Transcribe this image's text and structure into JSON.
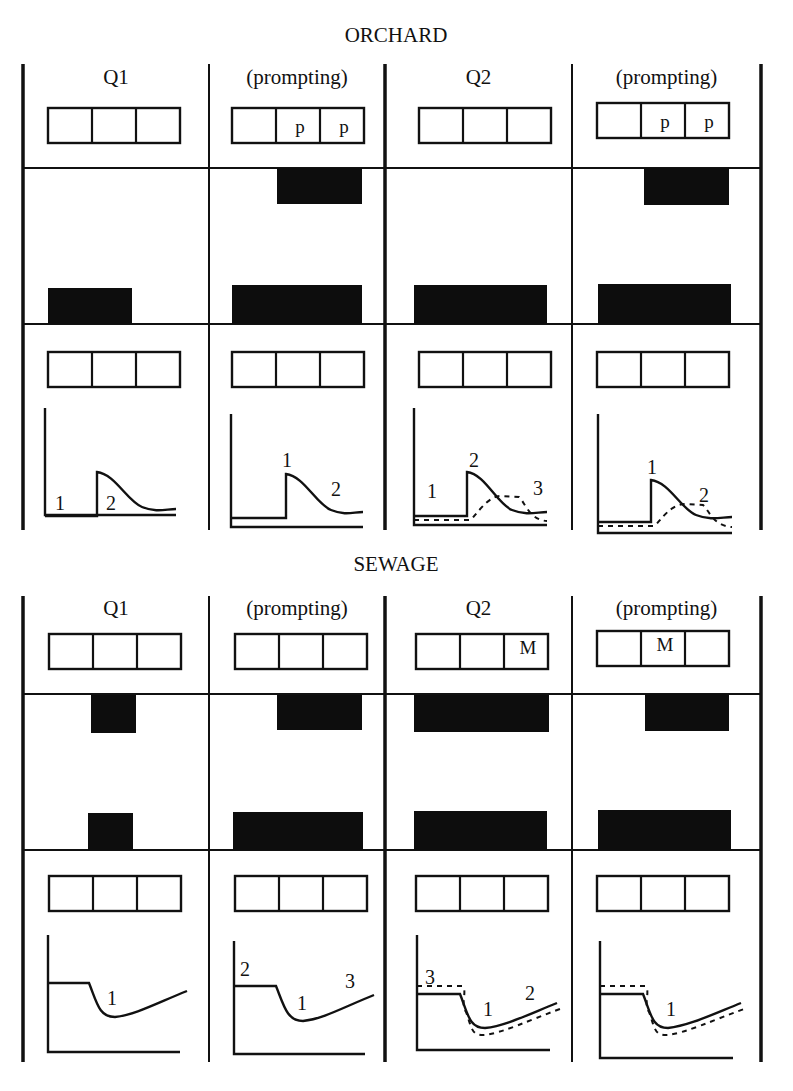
{
  "figure": {
    "stroke_color": "#111111",
    "fill_color": "#0d0d0d",
    "background": "#ffffff"
  },
  "panels": [
    {
      "title": "ORCHARD",
      "title_y": 42,
      "top": 62,
      "frame_top": 64,
      "frame_bottom": 530,
      "row_header_y": 84,
      "box_row1_y": 108,
      "hline1_y": 168,
      "hline2_y": 324,
      "box_row2_y": 352,
      "chart_top": 408,
      "chart_bottom": 527,
      "columns": [
        {
          "header": "Q1",
          "top_cells": [
            "",
            "",
            ""
          ],
          "top_box_x": 48,
          "upper_block": null,
          "lower_block": {
            "x": 48,
            "w": 84,
            "top": 288
          },
          "chart": {
            "type": "orchard-step",
            "baseline_y": 515,
            "axis_x": 45,
            "axis_right": 176,
            "step_x": 97,
            "low_y": 516,
            "peak_y": 472,
            "tail_y": 509,
            "dashed": false,
            "labels": [
              {
                "text": "1",
                "x": 55,
                "y": 510
              },
              {
                "text": "2",
                "x": 106,
                "y": 510
              }
            ]
          }
        },
        {
          "header": "(prompting)",
          "top_cells": [
            "",
            "p",
            "p"
          ],
          "top_box_x": 232,
          "upper_block": {
            "x": 277,
            "w": 85,
            "top": 168,
            "bottom": 204
          },
          "lower_block": {
            "x": 232,
            "w": 130,
            "top": 285
          },
          "chart": {
            "type": "orchard-step",
            "baseline_y": 527,
            "axis_x": 231,
            "axis_right": 363,
            "step_x": 286,
            "low_y": 518,
            "peak_y": 474,
            "tail_y": 512,
            "dashed": false,
            "labels": [
              {
                "text": "1",
                "x": 282,
                "y": 467
              },
              {
                "text": "2",
                "x": 331,
                "y": 496
              }
            ]
          }
        },
        {
          "header": "Q2",
          "top_cells": [
            "",
            "",
            ""
          ],
          "top_box_x": 419,
          "upper_block": null,
          "lower_block": {
            "x": 414,
            "w": 133,
            "top": 285
          },
          "chart": {
            "type": "orchard-step",
            "baseline_y": 525,
            "axis_x": 414,
            "axis_right": 547,
            "step_x": 467,
            "low_y": 516,
            "peak_y": 472,
            "tail_y": 512,
            "dashed": true,
            "labels": [
              {
                "text": "1",
                "x": 427,
                "y": 498
              },
              {
                "text": "2",
                "x": 469,
                "y": 467
              },
              {
                "text": "3",
                "x": 533,
                "y": 495
              }
            ]
          }
        },
        {
          "header": "(prompting)",
          "top_cells": [
            "",
            "p",
            "p"
          ],
          "top_box_x": 597,
          "upper_block": {
            "x": 644,
            "w": 85,
            "top": 168,
            "bottom": 205
          },
          "lower_block": {
            "x": 598,
            "w": 133,
            "top": 284
          },
          "chart": {
            "type": "orchard-step",
            "baseline_y": 533,
            "axis_x": 598,
            "axis_right": 732,
            "step_x": 651,
            "low_y": 522,
            "peak_y": 480,
            "tail_y": 517,
            "dashed": true,
            "labels": [
              {
                "text": "1",
                "x": 647,
                "y": 474
              },
              {
                "text": "2",
                "x": 699,
                "y": 502
              }
            ]
          }
        }
      ]
    },
    {
      "title": "SEWAGE",
      "title_y": 571,
      "top": 594,
      "frame_top": 596,
      "frame_bottom": 1062,
      "row_header_y": 615,
      "box_row1_y": 634,
      "hline1_y": 694,
      "hline2_y": 850,
      "box_row2_y": 876,
      "chart_top": 935,
      "chart_bottom": 1055,
      "columns": [
        {
          "header": "Q1",
          "top_cells": [
            "",
            "",
            ""
          ],
          "top_box_x": 49,
          "upper_block": {
            "x": 91,
            "w": 45,
            "top": 695,
            "bottom": 733
          },
          "lower_block": {
            "x": 88,
            "w": 45,
            "top": 813
          },
          "chart": {
            "type": "sewage-dip",
            "baseline_y": 1052,
            "axis_x": 48,
            "axis_right": 180,
            "plateau_y": 983,
            "plateau_end": 89,
            "min_x": 115,
            "min_y": 1017,
            "end_x": 187,
            "end_y": 991,
            "dashed": false,
            "labels": [
              {
                "text": "1",
                "x": 107,
                "y": 1005
              }
            ]
          }
        },
        {
          "header": "(prompting)",
          "top_cells": [
            "",
            "",
            ""
          ],
          "top_box_x": 235,
          "upper_block": {
            "x": 277,
            "w": 85,
            "top": 695,
            "bottom": 730
          },
          "lower_block": {
            "x": 233,
            "w": 130,
            "top": 812
          },
          "chart": {
            "type": "sewage-dip",
            "baseline_y": 1054,
            "axis_x": 234,
            "axis_right": 365,
            "plateau_y": 986,
            "plateau_end": 276,
            "min_x": 303,
            "min_y": 1021,
            "end_x": 374,
            "end_y": 995,
            "dashed": false,
            "labels": [
              {
                "text": "2",
                "x": 240,
                "y": 976
              },
              {
                "text": "3",
                "x": 345,
                "y": 988
              },
              {
                "text": "1",
                "x": 297,
                "y": 1010
              }
            ]
          }
        },
        {
          "header": "Q2",
          "top_cells": [
            "",
            "",
            "M"
          ],
          "top_box_x": 416,
          "upper_block": {
            "x": 414,
            "w": 135,
            "top": 695,
            "bottom": 732
          },
          "lower_block": {
            "x": 414,
            "w": 133,
            "top": 811
          },
          "chart": {
            "type": "sewage-dip",
            "baseline_y": 1050,
            "axis_x": 417,
            "axis_right": 550,
            "plateau_y": 994,
            "plateau_end": 460,
            "min_x": 485,
            "min_y": 1028,
            "end_x": 557,
            "end_y": 1003,
            "dashed": true,
            "labels": [
              {
                "text": "3",
                "x": 425,
                "y": 984
              },
              {
                "text": "1",
                "x": 483,
                "y": 1016
              },
              {
                "text": "2",
                "x": 525,
                "y": 1000
              }
            ]
          }
        },
        {
          "header": "(prompting)",
          "top_cells": [
            "",
            "M",
            ""
          ],
          "top_box_x": 597,
          "upper_block": {
            "x": 645,
            "w": 84,
            "top": 694,
            "bottom": 731
          },
          "lower_block": {
            "x": 598,
            "w": 133,
            "top": 810
          },
          "chart": {
            "type": "sewage-dip",
            "baseline_y": 1058,
            "axis_x": 600,
            "axis_right": 733,
            "plateau_y": 994,
            "plateau_end": 643,
            "min_x": 668,
            "min_y": 1028,
            "end_x": 741,
            "end_y": 1003,
            "dashed": true,
            "labels": [
              {
                "text": "1",
                "x": 666,
                "y": 1016
              }
            ]
          }
        }
      ]
    }
  ],
  "frame_x": [
    23,
    209,
    385,
    572,
    761
  ],
  "box": {
    "w": 132,
    "h": 35,
    "cell_count": 3
  }
}
